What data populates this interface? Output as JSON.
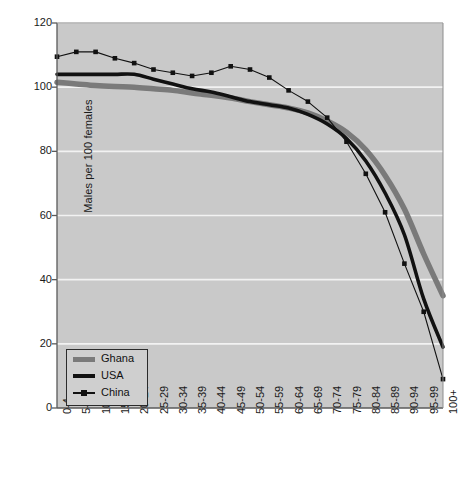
{
  "chart_data": {
    "type": "line",
    "title": "",
    "xlabel": "",
    "ylabel": "Males per 100 females",
    "ylim": [
      0,
      120
    ],
    "yticks": [
      0,
      20,
      40,
      60,
      80,
      100,
      120
    ],
    "grid": true,
    "legend_position": "bottom-left",
    "categories": [
      "0-4",
      "5-9",
      "10-14",
      "15-19",
      "20-24",
      "25-29",
      "30-34",
      "35-39",
      "40-44",
      "45-49",
      "50-54",
      "55-59",
      "60-64",
      "65-69",
      "70-74",
      "75-79",
      "80-84",
      "85-89",
      "90-94",
      "95-99",
      "100+"
    ],
    "series": [
      {
        "name": "Ghana",
        "color": "#7a7a7a",
        "style": "thick-gray",
        "values": [
          101.5,
          101.0,
          100.5,
          100.2,
          100.0,
          99.5,
          99.0,
          98.2,
          97.5,
          96.6,
          95.5,
          94.5,
          93.5,
          92.0,
          89.5,
          86.0,
          80.5,
          72.5,
          62.0,
          48.0,
          35.0
        ]
      },
      {
        "name": "USA",
        "color": "#111111",
        "style": "thick-black",
        "values": [
          104.0,
          104.0,
          104.0,
          104.0,
          104.0,
          102.5,
          101.0,
          99.5,
          98.5,
          97.0,
          95.5,
          94.5,
          93.5,
          91.5,
          88.5,
          84.0,
          77.0,
          67.0,
          54.0,
          34.0,
          19.0
        ]
      },
      {
        "name": "China",
        "color": "#111111",
        "style": "thin-black-markers",
        "values": [
          109.5,
          111.0,
          111.0,
          109.0,
          107.5,
          105.5,
          104.5,
          103.5,
          104.5,
          106.5,
          105.5,
          103.0,
          99.0,
          95.5,
          90.5,
          83.0,
          73.0,
          61.0,
          45.0,
          30.0,
          9.0
        ]
      }
    ]
  },
  "legend": {
    "items": [
      {
        "label": "Ghana"
      },
      {
        "label": "USA"
      },
      {
        "label": "China"
      }
    ]
  },
  "colors": {
    "plot_background": "#c9c9c9",
    "page_background": "#ffffff",
    "gridline": "#f2f2f2",
    "axis": "#5a5a5a",
    "ghana": "#7a7a7a",
    "usa": "#111111",
    "china": "#111111"
  }
}
